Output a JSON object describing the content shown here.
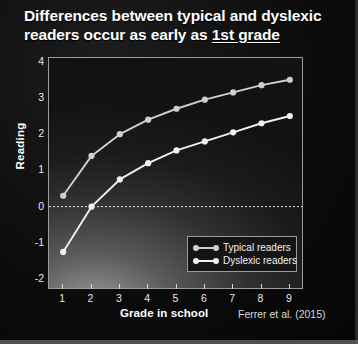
{
  "slide": {
    "title_line1": "Differences between typical and dyslexic",
    "title_line2_pre": "readers occur as early as ",
    "title_line2_underlined": "1st grade",
    "citation": "Ferrer et al. (2015)",
    "background_color": "#0a0a0a",
    "title_color": "#ffffff"
  },
  "chart_data": {
    "type": "line",
    "title": "Differences between typical and dyslexic readers occur as early as 1st grade",
    "xlabel": "Grade in school",
    "ylabel": "Reading",
    "x": [
      1,
      2,
      3,
      4,
      5,
      6,
      7,
      8,
      9
    ],
    "xticklabels": [
      "1",
      "2",
      "3",
      "4",
      "5",
      "6",
      "7",
      "8",
      "9"
    ],
    "yticklabels": [
      "4",
      "3",
      "2",
      "1",
      "0",
      "-1",
      "-2"
    ],
    "yticks": [
      4,
      3,
      2,
      1,
      0,
      -1,
      -2
    ],
    "xlim": [
      0.5,
      9.5
    ],
    "ylim": [
      -2.3,
      4.1
    ],
    "grid": false,
    "zero_reference_line": {
      "value": 0,
      "style": "dashed",
      "color": "#e8e8e8"
    },
    "legend_position": "lower right",
    "series": [
      {
        "name": "Typical readers",
        "color": "#cfcfcf",
        "marker": "circle",
        "values": [
          0.3,
          1.4,
          2.0,
          2.4,
          2.7,
          2.95,
          3.15,
          3.35,
          3.5
        ]
      },
      {
        "name": "Dyslexic readers",
        "color": "#f0f0f0",
        "marker": "circle",
        "values": [
          -1.25,
          0.0,
          0.75,
          1.2,
          1.55,
          1.8,
          2.05,
          2.3,
          2.5
        ]
      }
    ]
  }
}
